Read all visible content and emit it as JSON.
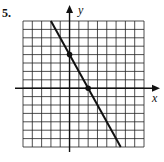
{
  "problem": {
    "number": "5."
  },
  "colors": {
    "grid": "#222222",
    "line": "#111111",
    "background": "#ffffff"
  },
  "chart_data": {
    "type": "line",
    "title": "",
    "xlabel": "x",
    "ylabel": "y",
    "grid": true,
    "xlim": [
      -5,
      8
    ],
    "ylim": [
      -7,
      8
    ],
    "grid_step": 1,
    "series": [
      {
        "name": "line",
        "equation": "y = -2x + 4",
        "slope": -2,
        "intercept": 4,
        "marked_points": [
          {
            "x": 0,
            "y": 4
          },
          {
            "x": 2,
            "y": 0
          }
        ]
      }
    ]
  }
}
